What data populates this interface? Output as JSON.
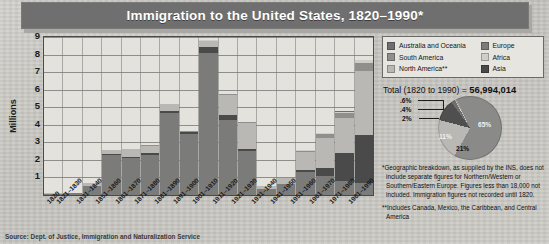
{
  "title": "Immigration to the United States, 1820–1990*",
  "source_note": "Source: Dept. of Justice, Immigration and Naturalization Service",
  "axis": {
    "ylabel": "Millions",
    "yticks": [
      "9",
      "8",
      "7",
      "6",
      "5",
      "4",
      "3",
      "2",
      "1"
    ]
  },
  "legend": {
    "left": [
      {
        "label": "Australia and Oceania",
        "color": "#6f6f6f"
      },
      {
        "label": "South America",
        "color": "#8f8f8d"
      },
      {
        "label": "North America**",
        "color": "#b9b8b4"
      }
    ],
    "right": [
      {
        "label": "Europe",
        "color": "#7b7b79"
      },
      {
        "label": "Africa",
        "color": "#cfcec9"
      },
      {
        "label": "Asia",
        "color": "#4a4a4a"
      }
    ]
  },
  "total": {
    "prefix": "Total (1820 to 1990) = ",
    "value": "56,994,014"
  },
  "notes": {
    "star": "*Geographic breakdown, as supplied by the INS, does not include separate figures for Northern/Western or Southern/Eastern Europe. Figures less than 18,000 not included. Immigration figures not recorded until 1820.",
    "doublestar": "**Includes Canada, Mexico, the Caribbean, and Central America"
  },
  "chart_data": {
    "type": "bar",
    "title": "Immigration to the United States, 1820–1990*",
    "xlabel": "",
    "ylabel": "Millions",
    "ylim": [
      0,
      9
    ],
    "grid": true,
    "stacked": true,
    "legend_position": "top-right",
    "categories": [
      "1820",
      "1821–1830",
      "1831–1840",
      "1851–1860",
      "1861–1870",
      "1871–1880",
      "1881–1890",
      "1891–1900",
      "1901–1910",
      "1911–1920",
      "1921–1930",
      "1931–1940",
      "1941–1950",
      "1951–1960",
      "1961–1970",
      "1971–1980",
      "1981–1990"
    ],
    "series": [
      {
        "name": "Europe",
        "color": "#7b7b79",
        "values": [
          0.08,
          0.1,
          0.5,
          2.3,
          2.1,
          2.3,
          4.7,
          3.5,
          8.1,
          4.3,
          2.5,
          0.35,
          0.6,
          1.3,
          1.1,
          0.8,
          0.7
        ]
      },
      {
        "name": "Asia",
        "color": "#4a4a4a",
        "values": [
          0.0,
          0.0,
          0.0,
          0.03,
          0.06,
          0.12,
          0.06,
          0.07,
          0.32,
          0.25,
          0.1,
          0.02,
          0.04,
          0.15,
          0.43,
          1.59,
          2.74
        ]
      },
      {
        "name": "North America**",
        "color": "#b9b8b4",
        "values": [
          0.01,
          0.02,
          0.2,
          0.25,
          0.45,
          0.4,
          0.43,
          0.04,
          0.36,
          1.14,
          1.52,
          0.16,
          0.35,
          1.0,
          1.7,
          1.98,
          3.6
        ]
      },
      {
        "name": "South America",
        "color": "#8f8f8d",
        "values": [
          0.0,
          0.0,
          0.0,
          0.01,
          0.01,
          0.01,
          0.01,
          0.01,
          0.02,
          0.04,
          0.04,
          0.01,
          0.02,
          0.08,
          0.26,
          0.3,
          0.46
        ]
      },
      {
        "name": "Africa",
        "color": "#cfcec9",
        "values": [
          0.0,
          0.0,
          0.0,
          0.0,
          0.0,
          0.0,
          0.0,
          0.0,
          0.01,
          0.01,
          0.01,
          0.0,
          0.01,
          0.01,
          0.03,
          0.08,
          0.18
        ]
      },
      {
        "name": "Australia and Oceania",
        "color": "#6f6f6f",
        "values": [
          0.0,
          0.0,
          0.0,
          0.0,
          0.0,
          0.01,
          0.01,
          0.0,
          0.01,
          0.01,
          0.01,
          0.0,
          0.01,
          0.01,
          0.03,
          0.04,
          0.04
        ]
      }
    ]
  },
  "pie_data": {
    "type": "pie",
    "title": "Total (1820 to 1990) = 56,994,014",
    "slices": [
      {
        "label": "65%",
        "value": 65,
        "name": "Europe",
        "color": "#8a8a88"
      },
      {
        "label": "21%",
        "value": 21,
        "name": "North America**",
        "color": "#b9b8b4"
      },
      {
        "label": "11%",
        "value": 11,
        "name": "Asia",
        "color": "#4f4f4f"
      },
      {
        "label": "2%",
        "value": 2,
        "name": "South America",
        "color": "#6f6f6f"
      },
      {
        "label": ".4%",
        "value": 0.4,
        "name": "Africa",
        "color": "#cfcec9"
      },
      {
        "label": ".6%",
        "value": 0.6,
        "name": "Australia and Oceania",
        "color": "#9b9b98"
      }
    ]
  }
}
